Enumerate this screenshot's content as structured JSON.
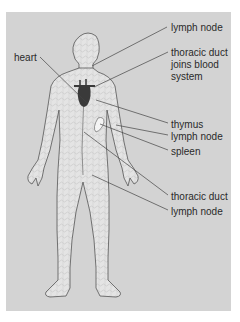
{
  "diagram": {
    "background_color": "#d3d3d3",
    "body_fill": "#e6e6e6",
    "heart_color": "#3a3a3a",
    "labels": [
      {
        "id": "heart",
        "text": "heart"
      },
      {
        "id": "lymph-node-neck",
        "text": "lymph node"
      },
      {
        "id": "thoracic-duct-joins",
        "text": "thoracic duct joins blood system"
      },
      {
        "id": "thymus",
        "text": "thymus"
      },
      {
        "id": "lymph-node-arm",
        "text": "lymph node"
      },
      {
        "id": "spleen",
        "text": "spleen"
      },
      {
        "id": "thoracic-duct",
        "text": "thoracic duct"
      },
      {
        "id": "lymph-node-groin",
        "text": "lymph node"
      }
    ],
    "text": {
      "heart": "heart",
      "lymph_node_1": "lymph node",
      "thoracic_duct_joins_l1": "thoracic duct",
      "thoracic_duct_joins_l2": "joins blood",
      "thoracic_duct_joins_l3": "system",
      "thymus": "thymus",
      "lymph_node_2": "lymph node",
      "spleen": "spleen",
      "thoracic_duct": "thoracic duct",
      "lymph_node_3": "lymph node"
    }
  }
}
